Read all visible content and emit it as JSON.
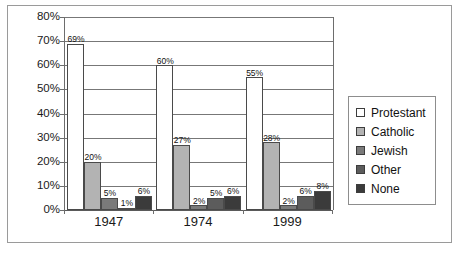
{
  "chart_data": {
    "type": "bar",
    "title": "",
    "subtitle": "",
    "xlabel": "",
    "ylabel": "",
    "categories": [
      "1947",
      "1974",
      "1999"
    ],
    "series": [
      {
        "name": "Protestant",
        "color": "#ffffff",
        "values": [
          69,
          60,
          55
        ],
        "labels": [
          "69%",
          "60%",
          "55%"
        ]
      },
      {
        "name": "Catholic",
        "color": "#b3b3b3",
        "values": [
          20,
          27,
          28
        ],
        "labels": [
          "20%",
          "27%",
          "28%"
        ]
      },
      {
        "name": "Jewish",
        "color": "#7a7a7a",
        "values": [
          5,
          2,
          2
        ],
        "labels": [
          "5%",
          "2%",
          "2%"
        ]
      },
      {
        "name": "Other",
        "color": "#5c5c5c",
        "values": [
          1,
          5,
          6
        ],
        "labels": [
          "1%",
          "5%",
          "6%"
        ]
      },
      {
        "name": "None",
        "color": "#3b3b3b",
        "values": [
          6,
          6,
          8
        ],
        "labels": [
          "6%",
          "6%",
          "8%"
        ]
      }
    ],
    "ylim": [
      0,
      80
    ],
    "ytick_values": [
      0,
      10,
      20,
      30,
      40,
      50,
      60,
      70,
      80
    ],
    "ytick_labels": [
      "0%",
      "10%",
      "20%",
      "30%",
      "40%",
      "50%",
      "60%",
      "70%",
      "80%"
    ],
    "grid": true,
    "grid_axis": "y",
    "legend_position": "right",
    "data_labels": true
  }
}
